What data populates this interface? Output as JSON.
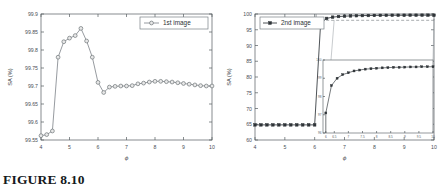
{
  "caption": "FIGURE 8.10",
  "colors": {
    "series_a": "#7c8288",
    "series_a_marker_fill": "#e8e8e8",
    "series_b": "#2f3438",
    "axis": "#555b60",
    "guide_dash": "#6d7378",
    "background": "#ffffff"
  },
  "chart_data": [
    {
      "type": "line",
      "id": "panel-a",
      "panel_label": "(a)",
      "title": "",
      "xlabel": "ϕ",
      "ylabel": "SA (%)",
      "xlim": [
        4,
        10
      ],
      "ylim": [
        99.55,
        99.9
      ],
      "xticks": [
        4,
        5,
        6,
        7,
        8,
        9,
        10
      ],
      "yticks": [
        99.55,
        99.6,
        99.65,
        99.7,
        99.75,
        99.8,
        99.85,
        99.9
      ],
      "ytick_labels": [
        "99.55",
        "99.6",
        "99.65",
        "99.7",
        "99.75",
        "99.8",
        "99.85",
        "99.9"
      ],
      "xtick_labels": [
        "4",
        "5",
        "6",
        "7",
        "8",
        "9",
        "10"
      ],
      "grid": false,
      "legend_position": "top-right",
      "series": [
        {
          "name": "1st image",
          "marker": "circle-open",
          "x": [
            4.0,
            4.2,
            4.4,
            4.6,
            4.8,
            5.0,
            5.2,
            5.4,
            5.6,
            5.8,
            6.0,
            6.2,
            6.4,
            6.6,
            6.8,
            7.0,
            7.2,
            7.4,
            7.6,
            7.8,
            8.0,
            8.2,
            8.4,
            8.6,
            8.8,
            9.0,
            9.2,
            9.4,
            9.6,
            9.8,
            10.0
          ],
          "values": [
            99.562,
            99.565,
            99.575,
            99.78,
            99.823,
            99.833,
            99.84,
            99.86,
            99.825,
            99.78,
            99.71,
            99.682,
            99.697,
            99.699,
            99.7,
            99.7,
            99.701,
            99.706,
            99.708,
            99.711,
            99.713,
            99.713,
            99.712,
            99.711,
            99.709,
            99.707,
            99.705,
            99.703,
            99.701,
            99.7,
            99.7
          ]
        }
      ]
    },
    {
      "type": "line",
      "id": "panel-b",
      "panel_label": "(b)",
      "title": "",
      "xlabel": "ϕ",
      "ylabel": "SA (%)",
      "xlim": [
        4,
        10
      ],
      "ylim": [
        60,
        100
      ],
      "xticks": [
        4,
        5,
        6,
        7,
        8,
        9,
        10
      ],
      "yticks": [
        60,
        65,
        70,
        75,
        80,
        85,
        90,
        95,
        100
      ],
      "ytick_labels": [
        "60",
        "65",
        "70",
        "75",
        "80",
        "85",
        "90",
        "95",
        "100"
      ],
      "xtick_labels": [
        "4",
        "5",
        "6",
        "7",
        "8",
        "9",
        "10"
      ],
      "grid": false,
      "legend_position": "top-left",
      "guides": {
        "vertical_dashed_x": 6.05,
        "horizontal_dashed_y": 98.0
      },
      "series": [
        {
          "name": "2nd image",
          "marker": "square-filled",
          "x": [
            4.0,
            4.2,
            4.4,
            4.6,
            4.8,
            5.0,
            5.2,
            5.4,
            5.6,
            5.8,
            6.0,
            6.2,
            6.4,
            6.6,
            6.8,
            7.0,
            7.2,
            7.4,
            7.6,
            7.8,
            8.0,
            8.2,
            8.4,
            8.6,
            8.8,
            9.0,
            9.2,
            9.4,
            9.6,
            9.8,
            10.0
          ],
          "values": [
            64.8,
            64.8,
            64.8,
            64.8,
            64.8,
            64.8,
            64.8,
            64.8,
            64.8,
            64.8,
            64.8,
            97.1,
            98.6,
            99.0,
            99.2,
            99.3,
            99.4,
            99.45,
            99.5,
            99.52,
            99.55,
            99.57,
            99.58,
            99.6,
            99.6,
            99.61,
            99.62,
            99.62,
            99.63,
            99.63,
            99.63
          ]
        }
      ],
      "inset": {
        "xlim": [
          6.1,
          10
        ],
        "ylim": [
          96,
          100
        ],
        "xticks": [
          6.2,
          6.5,
          7,
          7.5,
          8,
          8.5,
          9,
          9.5,
          10
        ],
        "xtick_labels": [
          "6",
          "6.5",
          "7",
          "7.5",
          "8",
          "8.5",
          "9",
          "9.5",
          "10"
        ],
        "yticks": [
          96,
          97,
          98,
          99,
          100
        ],
        "ytick_labels": [
          "96",
          "97",
          "98",
          "99",
          "100"
        ],
        "series": [
          {
            "name": "2nd image",
            "marker": "square-filled",
            "x": [
              6.2,
              6.4,
              6.6,
              6.8,
              7.0,
              7.2,
              7.4,
              7.6,
              7.8,
              8.0,
              8.2,
              8.4,
              8.6,
              8.8,
              9.0,
              9.2,
              9.4,
              9.6,
              9.8,
              10.0
            ],
            "values": [
              97.1,
              98.6,
              99.0,
              99.2,
              99.3,
              99.4,
              99.45,
              99.5,
              99.52,
              99.55,
              99.57,
              99.58,
              99.6,
              99.6,
              99.61,
              99.62,
              99.62,
              99.63,
              99.63,
              99.63
            ]
          }
        ]
      }
    }
  ]
}
